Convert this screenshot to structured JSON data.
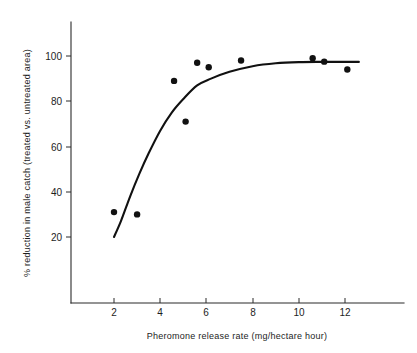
{
  "chart_data": {
    "type": "scatter",
    "title": "",
    "xlabel": "Pheromone release rate (mg/hectare hour)",
    "ylabel": "% reduction in male catch (treated vs. untreated area)",
    "xlim": [
      0,
      13.5
    ],
    "ylim": [
      0,
      112
    ],
    "grid": false,
    "legend": "none",
    "xticks": [
      2,
      4,
      6,
      8,
      10,
      12
    ],
    "xtick_labels": [
      "2",
      "4",
      "6",
      "8",
      "10",
      "12"
    ],
    "yticks": [
      20,
      40,
      60,
      80,
      100
    ],
    "ytick_labels": [
      "20",
      "40",
      "60",
      "80",
      "100"
    ],
    "points": [
      {
        "x": 2.0,
        "y": 31
      },
      {
        "x": 3.0,
        "y": 30
      },
      {
        "x": 4.6,
        "y": 89
      },
      {
        "x": 5.1,
        "y": 71
      },
      {
        "x": 5.6,
        "y": 97
      },
      {
        "x": 6.1,
        "y": 95
      },
      {
        "x": 7.5,
        "y": 98
      },
      {
        "x": 10.6,
        "y": 99
      },
      {
        "x": 11.1,
        "y": 97.5
      },
      {
        "x": 12.1,
        "y": 94
      }
    ],
    "fit_curve": {
      "name": "fitted dose-response curve",
      "x": [
        2.0,
        2.3,
        2.7,
        3.1,
        3.5,
        4.0,
        4.5,
        5.0,
        5.6,
        6.2,
        7.0,
        8.0,
        9.0,
        10.0,
        11.0,
        12.0,
        12.6
      ],
      "y": [
        20,
        27,
        38,
        48,
        57,
        67,
        75,
        81,
        87,
        90,
        93,
        95.5,
        96.8,
        97.3,
        97.4,
        97.4,
        97.4
      ]
    },
    "colors": {
      "marker": "#111111",
      "curve": "#111111",
      "axis": "#2b2b2b",
      "background": "#ffffff"
    }
  },
  "axes": {
    "x_axis_title": "Pheromone release rate (mg/hectare hour)",
    "y_axis_title": "% reduction in male catch (treated vs. untreated area)"
  }
}
